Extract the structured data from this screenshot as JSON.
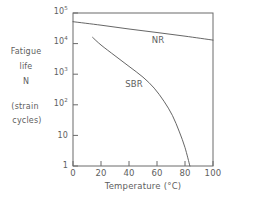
{
  "chart_data": {
    "type": "line",
    "title": "",
    "xlabel": "Temperature (°C)",
    "ylabel_lines": [
      "Fatigue",
      "life",
      "N",
      "(strain",
      "cycles)"
    ],
    "xlim": [
      0,
      100
    ],
    "ylim": [
      1,
      100000
    ],
    "yscale": "log",
    "grid": false,
    "legend_position": "inline-annotation",
    "xticks": [
      {
        "value": 0,
        "label": "0"
      },
      {
        "value": 20,
        "label": "20"
      },
      {
        "value": 40,
        "label": "40"
      },
      {
        "value": 60,
        "label": "60"
      },
      {
        "value": 80,
        "label": "80"
      },
      {
        "value": 100,
        "label": "100"
      }
    ],
    "yticks": [
      {
        "value": 100000,
        "mantissa": "10",
        "exponent": "5"
      },
      {
        "value": 10000,
        "mantissa": "10",
        "exponent": "4"
      },
      {
        "value": 1000,
        "mantissa": "10",
        "exponent": "3"
      },
      {
        "value": 100,
        "mantissa": "10",
        "exponent": "2"
      },
      {
        "value": 10,
        "mantissa": "10",
        "exponent": ""
      },
      {
        "value": 1,
        "mantissa": "1",
        "exponent": ""
      }
    ],
    "series": [
      {
        "name": "NR",
        "label": "NR",
        "color": "#555555",
        "points": [
          {
            "x": 0,
            "y": 52000
          },
          {
            "x": 20,
            "y": 40000
          },
          {
            "x": 40,
            "y": 30000
          },
          {
            "x": 60,
            "y": 23000
          },
          {
            "x": 80,
            "y": 17500
          },
          {
            "x": 100,
            "y": 13000
          }
        ]
      },
      {
        "name": "SBR",
        "label": "SBR",
        "color": "#555555",
        "points": [
          {
            "x": 14,
            "y": 16000
          },
          {
            "x": 20,
            "y": 9000
          },
          {
            "x": 30,
            "y": 4000
          },
          {
            "x": 40,
            "y": 1800
          },
          {
            "x": 50,
            "y": 800
          },
          {
            "x": 58,
            "y": 350
          },
          {
            "x": 65,
            "y": 130
          },
          {
            "x": 71,
            "y": 45
          },
          {
            "x": 76,
            "y": 13
          },
          {
            "x": 80,
            "y": 4
          },
          {
            "x": 83.5,
            "y": 1
          }
        ]
      }
    ],
    "annotations": [
      {
        "name": "NR",
        "text": "NR",
        "x": 60,
        "y": 26000
      },
      {
        "name": "SBR",
        "text": "SBR",
        "x": 42,
        "y": 420
      }
    ]
  }
}
